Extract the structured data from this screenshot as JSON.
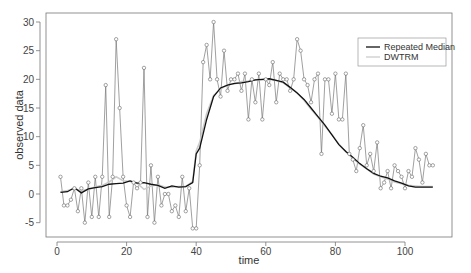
{
  "chart_data": {
    "type": "line",
    "title": "",
    "xlabel": "time",
    "ylabel": "observed data",
    "xlim": [
      -3,
      113
    ],
    "ylim": [
      -7,
      31
    ],
    "xticks": [
      0,
      20,
      40,
      60,
      80,
      100
    ],
    "yticks": [
      -5,
      0,
      5,
      10,
      15,
      20,
      25,
      30
    ],
    "grid": false,
    "legend_position": "top-right",
    "legend": [
      "Repeated Median",
      "DWTRM"
    ],
    "observed": {
      "name": "observed data",
      "style": "points-and-lines",
      "x": [
        1,
        2,
        3,
        4,
        5,
        6,
        7,
        8,
        9,
        10,
        11,
        12,
        13,
        14,
        15,
        16,
        17,
        18,
        19,
        20,
        21,
        22,
        23,
        24,
        25,
        26,
        27,
        28,
        29,
        30,
        31,
        32,
        33,
        34,
        35,
        36,
        37,
        38,
        39,
        40,
        41,
        42,
        43,
        44,
        45,
        46,
        47,
        48,
        49,
        50,
        51,
        52,
        53,
        54,
        55,
        56,
        57,
        58,
        59,
        60,
        61,
        62,
        63,
        64,
        65,
        66,
        67,
        68,
        69,
        70,
        71,
        72,
        73,
        74,
        75,
        76,
        77,
        78,
        79,
        80,
        81,
        82,
        83,
        84,
        85,
        86,
        87,
        88,
        89,
        90,
        91,
        92,
        93,
        94,
        95,
        96,
        97,
        98,
        99,
        100,
        101,
        102,
        103,
        104,
        105,
        106,
        107,
        108
      ],
      "y": [
        3,
        -2,
        -2,
        -1,
        1,
        -3,
        1,
        -5,
        2,
        -4,
        3,
        -4,
        3,
        19,
        -4,
        3,
        27,
        15,
        3,
        -2,
        -4,
        2,
        1,
        2,
        22,
        -4,
        5,
        -5,
        3,
        -2,
        0,
        0,
        -3,
        -2,
        -4,
        3,
        -3,
        1,
        -6,
        -6,
        5,
        23,
        26,
        20,
        30,
        20,
        17,
        25,
        18,
        20,
        20,
        21,
        18,
        21,
        13,
        20,
        16,
        21,
        13,
        20,
        19,
        23,
        16,
        21,
        20,
        20,
        18,
        20,
        27,
        25,
        20,
        19,
        16,
        20,
        21,
        7,
        20,
        20,
        14,
        21,
        13,
        13,
        21,
        7,
        6,
        4,
        8,
        12,
        5,
        7,
        4,
        9,
        1,
        2,
        4,
        1,
        5,
        4,
        3,
        1,
        4,
        3,
        8,
        6,
        2,
        7,
        5,
        5,
        1,
        3,
        -6
      ],
      "color": "#555555"
    },
    "series": [
      {
        "name": "Repeated Median",
        "color": "#111111",
        "x": [
          1,
          3,
          5,
          7,
          9,
          11,
          13,
          15,
          17,
          19,
          21,
          23,
          25,
          27,
          29,
          31,
          33,
          35,
          37,
          39,
          40,
          41,
          43,
          45,
          47,
          49,
          51,
          53,
          55,
          57,
          59,
          61,
          63,
          65,
          67,
          69,
          71,
          73,
          75,
          77,
          79,
          81,
          83,
          85,
          87,
          89,
          91,
          93,
          95,
          97,
          99,
          101,
          103,
          105,
          107,
          108
        ],
        "values": [
          0.3,
          0.4,
          1.1,
          0.2,
          0.9,
          1.1,
          1.3,
          1.7,
          1.8,
          1.9,
          2.3,
          1.9,
          2.0,
          1.7,
          1.5,
          1.0,
          1.4,
          1.2,
          1.3,
          2.0,
          7.0,
          8.0,
          13.0,
          17.0,
          18.5,
          19.0,
          19.3,
          19.4,
          19.6,
          19.9,
          20.0,
          20.1,
          19.8,
          19.5,
          18.6,
          17.6,
          16.5,
          15.0,
          13.5,
          12.0,
          10.3,
          8.6,
          7.4,
          6.4,
          5.3,
          4.4,
          3.6,
          3.1,
          2.8,
          2.3,
          1.9,
          1.4,
          1.2,
          1.2,
          1.2,
          1.2
        ]
      },
      {
        "name": "DWTRM",
        "color": "#cccccc",
        "x": [
          1,
          3,
          5,
          7,
          9,
          11,
          13,
          15,
          17,
          19,
          21,
          23,
          25,
          27,
          29,
          31,
          33,
          35,
          37,
          39,
          40,
          41,
          43,
          45,
          47,
          49,
          51,
          53,
          55,
          57,
          59,
          61,
          63,
          65,
          67,
          69,
          71,
          73,
          75,
          77,
          79,
          81,
          83,
          85,
          87,
          89,
          91,
          93,
          95,
          97,
          99,
          101,
          103,
          105,
          107,
          108
        ],
        "values": [
          0.4,
          0.6,
          0.9,
          0.6,
          0.8,
          1.2,
          1.5,
          2.1,
          3.0,
          2.3,
          2.2,
          1.9,
          0.8,
          1.4,
          1.6,
          1.2,
          1.2,
          1.3,
          1.3,
          2.2,
          7.5,
          9.0,
          14.0,
          17.2,
          18.3,
          19.1,
          19.2,
          19.6,
          19.7,
          19.9,
          19.9,
          20.0,
          19.8,
          19.4,
          18.5,
          17.7,
          16.3,
          14.8,
          13.4,
          11.8,
          10.4,
          8.7,
          7.4,
          6.2,
          5.2,
          4.4,
          3.5,
          3.0,
          2.6,
          2.1,
          1.8,
          1.5,
          1.4,
          1.3,
          1.3,
          1.3
        ]
      }
    ]
  },
  "legend": {
    "items": [
      {
        "label": "Repeated Median",
        "color": "#111111"
      },
      {
        "label": "DWTRM",
        "color": "#cccccc"
      }
    ]
  },
  "axes": {
    "xlabel": "time",
    "ylabel": "observed data",
    "xtick_labels": [
      "0",
      "20",
      "40",
      "60",
      "80",
      "100"
    ],
    "ytick_labels": [
      "-5",
      "0",
      "5",
      "10",
      "15",
      "20",
      "25",
      "30"
    ]
  }
}
